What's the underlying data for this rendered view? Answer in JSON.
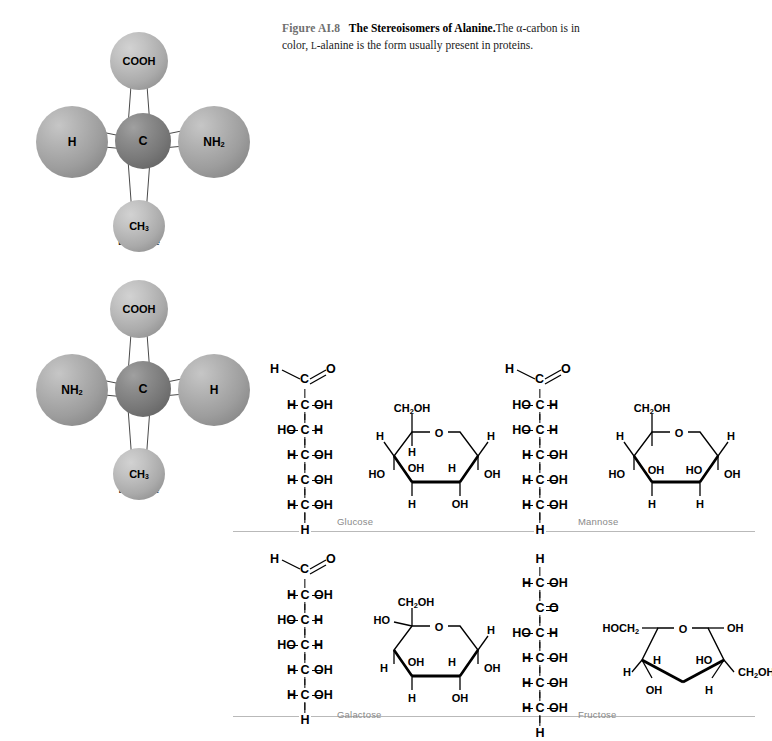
{
  "caption": {
    "figure_number": "Figure AI.8",
    "title": "The Stereoisomers of Alanine.",
    "body_1": "The ",
    "alpha": "α",
    "body_2": "-carbon is in color, ",
    "l_small": "l",
    "body_3": "-alanine is the form usually present in proteins."
  },
  "models": [
    {
      "name": "d-alanine",
      "name_prefix": "d",
      "name_rest": "-alanine",
      "center": {
        "label": "C",
        "sphere": "dark"
      },
      "top": {
        "label": "COOH",
        "sphere": "light"
      },
      "left": {
        "label": "H",
        "sphere": "mid"
      },
      "right": {
        "label": "NH",
        "sub": "2",
        "sphere": "mid"
      },
      "bottom": {
        "label": "CH",
        "sub": "3",
        "sphere": "light"
      }
    },
    {
      "name": "l-alanine",
      "name_prefix": "l",
      "name_rest": "-alanine",
      "center": {
        "label": "C",
        "sphere": "dark"
      },
      "top": {
        "label": "COOH",
        "sphere": "light"
      },
      "left": {
        "label": "NH",
        "sub": "2",
        "sphere": "mid"
      },
      "right": {
        "label": "H",
        "sphere": "mid"
      },
      "bottom": {
        "label": "CH",
        "sub": "3",
        "sphere": "light"
      }
    }
  ],
  "sugars": [
    {
      "name": "Glucose",
      "fischer": {
        "top": {
          "left": "H",
          "center": "C",
          "right": "O",
          "double_bond": true
        },
        "rows": [
          {
            "left": "H",
            "center": "C",
            "right": "OH"
          },
          {
            "left": "HO",
            "center": "C",
            "right": "H"
          },
          {
            "left": "H",
            "center": "C",
            "right": "OH"
          },
          {
            "left": "H",
            "center": "C",
            "right": "OH"
          },
          {
            "left": "H",
            "center": "C",
            "right": "OH"
          }
        ],
        "bottom": "H"
      },
      "haworth": {
        "ring": "pyranose",
        "o_label": "O",
        "c6": "CH2OH",
        "up_left": "H",
        "up_right": "H",
        "inner_left": "H",
        "inner_mid_left": "OH",
        "inner_mid_right": "H",
        "far_left": "HO",
        "far_right": "OH",
        "down_left": "H",
        "down_right": "OH"
      }
    },
    {
      "name": "Mannose",
      "fischer": {
        "top": {
          "left": "H",
          "center": "C",
          "right": "O",
          "double_bond": true
        },
        "rows": [
          {
            "left": "HO",
            "center": "C",
            "right": "H"
          },
          {
            "left": "HO",
            "center": "C",
            "right": "H"
          },
          {
            "left": "H",
            "center": "C",
            "right": "OH"
          },
          {
            "left": "H",
            "center": "C",
            "right": "OH"
          },
          {
            "left": "H",
            "center": "C",
            "right": "OH"
          }
        ],
        "bottom": "H"
      },
      "haworth": {
        "ring": "pyranose",
        "o_label": "O",
        "c6": "CH2OH",
        "up_left": "H",
        "up_right": "H",
        "inner_left": "OH",
        "inner_mid_left": "HO",
        "far_left": "HO",
        "far_right": "OH",
        "down_left": "H",
        "down_right": "H"
      }
    },
    {
      "name": "Galactose",
      "fischer": {
        "top": {
          "left": "H",
          "center": "C",
          "right": "O",
          "double_bond": true
        },
        "rows": [
          {
            "left": "H",
            "center": "C",
            "right": "OH"
          },
          {
            "left": "HO",
            "center": "C",
            "right": "H"
          },
          {
            "left": "HO",
            "center": "C",
            "right": "H"
          },
          {
            "left": "H",
            "center": "C",
            "right": "OH"
          },
          {
            "left": "H",
            "center": "C",
            "right": "OH"
          }
        ],
        "bottom": "H"
      },
      "haworth": {
        "ring": "pyranose",
        "o_label": "O",
        "c6": "CH2OH",
        "up_left": "HO",
        "up_right": "H",
        "inner_left": "H",
        "inner_mid_left": "OH",
        "inner_mid_right": "H",
        "far_right": "OH",
        "down_left": "H",
        "down_right": "OH"
      }
    },
    {
      "name": "Fructose",
      "fischer": {
        "top_single": "H",
        "rows": [
          {
            "left": "H",
            "center": "C",
            "right": "OH"
          },
          {
            "left": "",
            "center": "C",
            "right": "O",
            "double_bond_h": true
          },
          {
            "left": "HO",
            "center": "C",
            "right": "H"
          },
          {
            "left": "H",
            "center": "C",
            "right": "OH"
          },
          {
            "left": "H",
            "center": "C",
            "right": "OH"
          },
          {
            "left": "H",
            "center": "C",
            "right": "OH"
          }
        ],
        "bottom": "H"
      },
      "haworth": {
        "ring": "furanose",
        "o_label": "O",
        "c1": "HOCH2",
        "top_right_oh": "OH",
        "inner_h": "H",
        "inner_ho": "HO",
        "left_h": "H",
        "right_ch2oh": "CH2OH",
        "down_left": "OH",
        "down_right": "H"
      }
    }
  ],
  "separators": 3
}
